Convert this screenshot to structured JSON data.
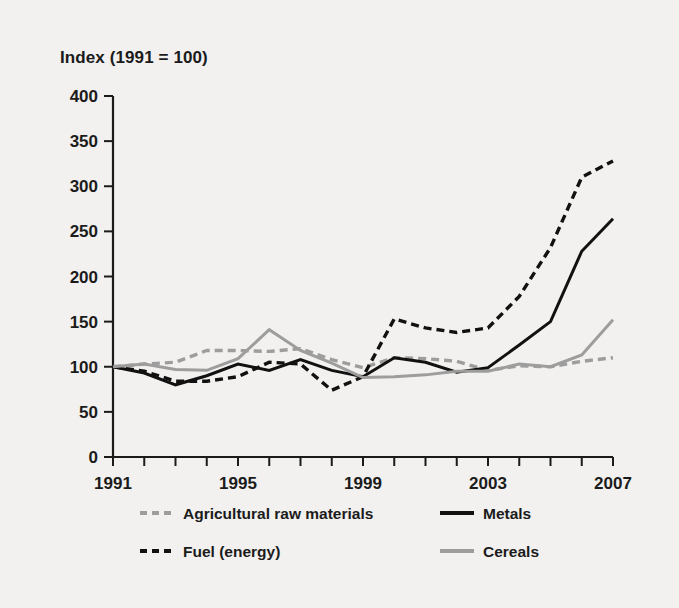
{
  "chart_data": {
    "type": "line",
    "title": "Index (1991 = 100)",
    "xlabel": "",
    "ylabel": "",
    "xlim": [
      1991,
      2007
    ],
    "ylim": [
      0,
      400
    ],
    "ytick_step": 50,
    "xtick_step": 1,
    "grid": false,
    "legend_position": "bottom",
    "x": [
      1991,
      1992,
      1993,
      1994,
      1995,
      1996,
      1997,
      1998,
      1999,
      2000,
      2001,
      2002,
      2003,
      2004,
      2005,
      2006,
      2007
    ],
    "ytick_labels": [
      "0",
      "50",
      "100",
      "150",
      "200",
      "250",
      "300",
      "350",
      "400"
    ],
    "xtick_labels": [
      "1991",
      "1995",
      "1999",
      "2003",
      "2007"
    ],
    "xtick_labeled_values": [
      1991,
      1995,
      1999,
      2003,
      2007
    ],
    "series": [
      {
        "name": "Agricultural raw materials",
        "color": "#9d9d9d",
        "style": "dashed",
        "values": [
          100,
          103,
          105,
          118,
          118,
          117,
          120,
          108,
          99,
          110,
          109,
          106,
          96,
          101,
          100,
          106,
          110
        ]
      },
      {
        "name": "Metals",
        "color": "#111111",
        "style": "solid",
        "values": [
          100,
          93,
          80,
          90,
          103,
          96,
          108,
          96,
          89,
          110,
          105,
          94,
          99,
          124,
          150,
          228,
          264
        ]
      },
      {
        "name": "Fuel (energy)",
        "color": "#111111",
        "style": "dashed",
        "values": [
          100,
          95,
          84,
          84,
          89,
          105,
          103,
          74,
          89,
          153,
          143,
          138,
          143,
          178,
          232,
          310,
          328
        ]
      },
      {
        "name": "Cereals",
        "color": "#9d9d9d",
        "style": "solid",
        "values": [
          100,
          103,
          97,
          96,
          109,
          141,
          118,
          104,
          88,
          89,
          91,
          95,
          95,
          103,
          100,
          113,
          152
        ]
      }
    ]
  },
  "legend": {
    "entries": [
      {
        "label": "Agricultural raw materials",
        "marker": "dashed-gray-line-icon"
      },
      {
        "label": "Metals",
        "marker": "solid-black-line-icon"
      },
      {
        "label": "Fuel (energy)",
        "marker": "dashed-black-line-icon"
      },
      {
        "label": "Cereals",
        "marker": "solid-gray-line-icon"
      }
    ]
  },
  "colors": {
    "background": "#f2f1ef",
    "axis": "#1b1b1b",
    "gray_series": "#9d9d9d",
    "black_series": "#111111"
  }
}
